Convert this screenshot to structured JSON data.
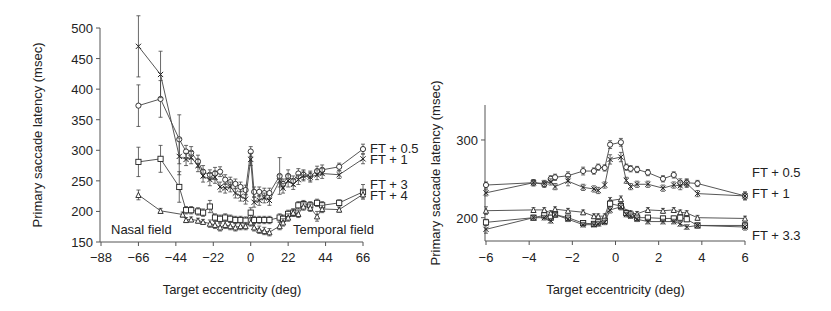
{
  "chart_data": [
    {
      "id": "left",
      "type": "line",
      "title": "",
      "xlabel": "Target eccentricity (deg)",
      "ylabel": "Primary saccade latency (msec)",
      "xlim": [
        -88,
        66
      ],
      "ylim": [
        150,
        500
      ],
      "xticks": [
        -88,
        -66,
        -44,
        -22,
        0,
        22,
        44,
        66
      ],
      "yticks": [
        150,
        200,
        250,
        300,
        350,
        400,
        450,
        500
      ],
      "grid": false,
      "annotations": [
        {
          "text": "Nasal field",
          "x": -74,
          "y": 165
        },
        {
          "text": "Temporal field",
          "x": 50,
          "y": 165
        }
      ],
      "legend": [
        "FT + 0.5",
        "FT + 1",
        "FT + 3",
        "FT + 4"
      ],
      "series": [
        {
          "name": "FT + 0.5",
          "marker": "circle",
          "x": [
            -66,
            -53,
            -42,
            -38,
            -35,
            -31,
            -28,
            -24,
            -21,
            -18,
            -15,
            -12,
            -9,
            -6,
            -3,
            0,
            2,
            5,
            8,
            11,
            17,
            19,
            22,
            25,
            28,
            31,
            35,
            39,
            42,
            52,
            66
          ],
          "y": [
            373,
            384,
            318,
            298,
            296,
            282,
            265,
            260,
            262,
            265,
            252,
            248,
            245,
            240,
            235,
            298,
            232,
            232,
            230,
            230,
            258,
            245,
            258,
            250,
            262,
            260,
            258,
            266,
            268,
            273,
            302
          ],
          "err": [
            34,
            30,
            40,
            10,
            10,
            10,
            10,
            8,
            10,
            8,
            8,
            8,
            8,
            8,
            8,
            8,
            8,
            8,
            8,
            8,
            30,
            8,
            10,
            8,
            8,
            8,
            8,
            8,
            8,
            6,
            8
          ]
        },
        {
          "name": "FT + 1",
          "marker": "cross",
          "x": [
            -66,
            -53,
            -42,
            -38,
            -35,
            -31,
            -28,
            -24,
            -21,
            -18,
            -15,
            -12,
            -9,
            -6,
            -3,
            0,
            2,
            5,
            8,
            11,
            17,
            19,
            22,
            25,
            28,
            31,
            35,
            39,
            42,
            52,
            66
          ],
          "y": [
            470,
            424,
            290,
            285,
            288,
            275,
            258,
            252,
            256,
            240,
            238,
            240,
            230,
            225,
            220,
            285,
            215,
            218,
            222,
            218,
            250,
            238,
            250,
            244,
            252,
            258,
            256,
            260,
            262,
            260,
            286
          ],
          "err": [
            50,
            38,
            30,
            10,
            10,
            10,
            10,
            10,
            10,
            8,
            8,
            8,
            8,
            8,
            8,
            10,
            8,
            8,
            8,
            8,
            10,
            8,
            10,
            8,
            8,
            8,
            8,
            8,
            8,
            6,
            8
          ]
        },
        {
          "name": "FT + 3",
          "marker": "square",
          "x": [
            -66,
            -53,
            -42,
            -38,
            -35,
            -31,
            -28,
            -24,
            -21,
            -18,
            -15,
            -12,
            -9,
            -6,
            -3,
            0,
            2,
            5,
            8,
            11,
            17,
            19,
            22,
            25,
            28,
            31,
            35,
            39,
            42,
            52,
            66
          ],
          "y": [
            281,
            286,
            240,
            202,
            202,
            200,
            198,
            208,
            190,
            188,
            190,
            188,
            186,
            186,
            185,
            198,
            186,
            186,
            186,
            186,
            190,
            188,
            196,
            198,
            210,
            212,
            210,
            214,
            210,
            214,
            232
          ],
          "err": [
            24,
            22,
            25,
            6,
            6,
            6,
            6,
            10,
            6,
            6,
            6,
            6,
            6,
            6,
            6,
            8,
            6,
            6,
            6,
            6,
            6,
            6,
            6,
            6,
            6,
            6,
            6,
            6,
            6,
            5,
            12
          ]
        },
        {
          "name": "FT + 4",
          "marker": "triangle",
          "x": [
            -66,
            -53,
            -40,
            -38,
            -35,
            -31,
            -28,
            -24,
            -21,
            -18,
            -15,
            -12,
            -9,
            -6,
            -3,
            0,
            2,
            5,
            8,
            11,
            17,
            19,
            22,
            25,
            28,
            31,
            35,
            39,
            42,
            52,
            66
          ],
          "y": [
            227,
            201,
            195,
            186,
            187,
            185,
            183,
            180,
            178,
            174,
            178,
            176,
            174,
            176,
            176,
            182,
            174,
            170,
            168,
            166,
            176,
            182,
            190,
            198,
            196,
            208,
            206,
            192,
            204,
            203,
            228
          ],
          "err": [
            8,
            4,
            4,
            4,
            4,
            4,
            4,
            6,
            6,
            6,
            6,
            6,
            6,
            6,
            6,
            6,
            6,
            6,
            6,
            6,
            6,
            6,
            6,
            6,
            6,
            6,
            6,
            8,
            6,
            4,
            6
          ]
        }
      ]
    },
    {
      "id": "right",
      "type": "line",
      "title": "",
      "xlabel": "Target eccentricity (deg)",
      "ylabel": "Primary saccade latency (msec)",
      "xlim": [
        -6,
        6
      ],
      "ylim": [
        170,
        345
      ],
      "xticks": [
        -6,
        -4,
        -2,
        0,
        2,
        4,
        6
      ],
      "yticks": [
        200,
        300
      ],
      "grid": false,
      "legend": [
        "FT + 0.5",
        "FT + 1",
        "FT + 3.3"
      ],
      "series": [
        {
          "name": "FT + 0.5",
          "marker": "circle",
          "x": [
            -6,
            -3.8,
            -3.3,
            -3.0,
            -2.8,
            -2.2,
            -1.5,
            -1.0,
            -0.8,
            -0.5,
            -0.25,
            0.25,
            0.5,
            0.7,
            1.0,
            1.5,
            2.2,
            2.7,
            3.0,
            3.3,
            3.8,
            6
          ],
          "y": [
            242,
            245,
            243,
            250,
            252,
            254,
            260,
            260,
            265,
            264,
            294,
            297,
            265,
            263,
            262,
            258,
            250,
            255,
            245,
            245,
            244,
            228
          ],
          "err": [
            4,
            4,
            4,
            4,
            4,
            5,
            5,
            4,
            4,
            4,
            5,
            5,
            4,
            4,
            4,
            4,
            4,
            4,
            5,
            5,
            4,
            5
          ]
        },
        {
          "name": "FT + 1",
          "marker": "cross",
          "x": [
            -6,
            -3.8,
            -3.3,
            -3.0,
            -2.8,
            -2.2,
            -1.5,
            -1.0,
            -0.8,
            -0.5,
            -0.25,
            0.25,
            0.5,
            0.7,
            1.0,
            1.5,
            2.2,
            2.7,
            3.0,
            3.3,
            3.8,
            6
          ],
          "y": [
            232,
            245,
            244,
            246,
            240,
            247,
            239,
            237,
            235,
            242,
            275,
            278,
            248,
            240,
            243,
            243,
            238,
            242,
            241,
            244,
            231,
            228
          ],
          "err": [
            4,
            4,
            4,
            4,
            4,
            6,
            4,
            4,
            4,
            4,
            6,
            6,
            4,
            4,
            4,
            4,
            4,
            4,
            5,
            5,
            4,
            5
          ]
        },
        {
          "name": "FT + 3.3 (a)",
          "marker": "triangle",
          "x": [
            -6,
            -3.8,
            -3.3,
            -3.0,
            -2.8,
            -2.2,
            -1.5,
            -1.0,
            -0.8,
            -0.5,
            -0.25,
            0.25,
            0.5,
            0.7,
            1.0,
            1.5,
            2.2,
            2.7,
            3.0,
            3.3,
            3.8,
            6
          ],
          "y": [
            209,
            210,
            210,
            206,
            211,
            209,
            207,
            202,
            202,
            202,
            222,
            224,
            207,
            206,
            205,
            210,
            209,
            210,
            207,
            206,
            200,
            199
          ],
          "err": [
            5,
            3,
            3,
            3,
            3,
            3,
            3,
            3,
            3,
            3,
            4,
            4,
            3,
            3,
            3,
            3,
            3,
            3,
            3,
            3,
            3,
            3
          ]
        },
        {
          "name": "FT + 3.3 (b)",
          "marker": "square",
          "x": [
            -6,
            -3.8,
            -3.3,
            -3.0,
            -2.8,
            -2.2,
            -1.5,
            -1.0,
            -0.8,
            -0.5,
            -0.25,
            0.25,
            0.5,
            0.7,
            1.0,
            1.5,
            2.2,
            2.7,
            3.0,
            3.3,
            3.8,
            6
          ],
          "y": [
            194,
            200,
            203,
            200,
            204,
            200,
            193,
            192,
            194,
            196,
            218,
            215,
            206,
            204,
            200,
            200,
            199,
            199,
            200,
            198,
            190,
            190
          ],
          "err": [
            4,
            3,
            3,
            3,
            3,
            3,
            3,
            3,
            3,
            3,
            4,
            4,
            3,
            3,
            3,
            3,
            3,
            3,
            3,
            3,
            3,
            4
          ]
        },
        {
          "name": "FT + 3.3 (c)",
          "marker": "cross",
          "x": [
            -6,
            -3.8,
            -3.3,
            -3.0,
            -2.8,
            -2.2,
            -1.5,
            -1.0,
            -0.8,
            -0.5,
            -0.25,
            0.25,
            0.5,
            0.7,
            1.0,
            1.5,
            2.2,
            2.7,
            3.0,
            3.3,
            3.8,
            6
          ],
          "y": [
            185,
            200,
            200,
            196,
            204,
            198,
            191,
            191,
            192,
            194,
            210,
            214,
            204,
            202,
            198,
            195,
            195,
            195,
            192,
            188,
            190,
            188
          ],
          "err": [
            5,
            3,
            3,
            3,
            3,
            3,
            3,
            3,
            3,
            3,
            4,
            4,
            3,
            3,
            3,
            3,
            3,
            3,
            3,
            3,
            3,
            4
          ]
        }
      ]
    }
  ],
  "labels": {
    "left_ylabel": "Primary saccade latency (msec)",
    "left_xlabel": "Target eccentricity (deg)",
    "right_ylabel": "Primary saccade latency (msec)",
    "right_xlabel": "Target eccentricity (deg)",
    "nasal_field": "Nasal field",
    "temporal_field": "Temporal field",
    "left_legend": [
      "FT + 0.5",
      "FT + 1",
      "FT + 3",
      "FT + 4"
    ],
    "right_legend": [
      "FT + 0.5",
      "FT + 1",
      "FT + 3.3"
    ]
  }
}
